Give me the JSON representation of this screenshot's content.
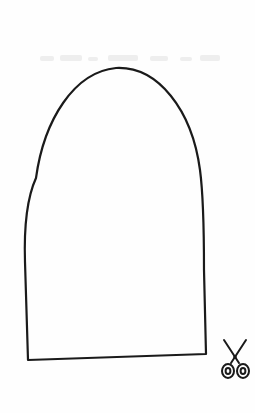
{
  "page": {
    "type": "cut-out template",
    "background_color": "#ffffff",
    "line_color": "#1a1a1a"
  },
  "template": {
    "shape": "arch",
    "outline": {
      "top_apex": [
        116,
        68
      ],
      "bottom_left": [
        28,
        360
      ],
      "bottom_right": [
        206,
        354
      ]
    },
    "cut_icon": "scissors-icon"
  }
}
